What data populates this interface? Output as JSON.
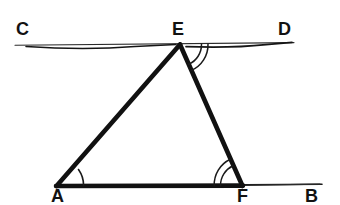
{
  "figure": {
    "background_color": "#ffffff",
    "ink_color": "#111111",
    "labels": [
      {
        "name": "C",
        "text": "C",
        "x": 16,
        "y": 20
      },
      {
        "name": "E",
        "text": "E",
        "x": 172,
        "y": 20
      },
      {
        "name": "D",
        "text": "D",
        "x": 278,
        "y": 20
      },
      {
        "name": "A",
        "text": "A",
        "x": 51,
        "y": 187
      },
      {
        "name": "F",
        "text": "F",
        "x": 237,
        "y": 187
      },
      {
        "name": "B",
        "text": "B",
        "x": 305,
        "y": 187
      }
    ],
    "points": {
      "A": {
        "x": 56,
        "y": 186
      },
      "B": {
        "x": 322,
        "y": 184
      },
      "C": {
        "x": 15,
        "y": 45
      },
      "D": {
        "x": 294,
        "y": 42
      },
      "E": {
        "x": 180,
        "y": 44
      },
      "F": {
        "x": 242,
        "y": 186
      }
    },
    "segments": [
      {
        "name": "line-cd",
        "from": "C",
        "to": "D",
        "weight": "thin",
        "label": "CD"
      },
      {
        "name": "line-ab",
        "from": "A",
        "to": "B",
        "weight": "thin",
        "label": "AB"
      },
      {
        "name": "side-af",
        "from": "A",
        "to": "F",
        "weight": "thick",
        "label": "AF"
      },
      {
        "name": "side-ae",
        "from": "A",
        "to": "E",
        "weight": "thick",
        "label": "AE"
      },
      {
        "name": "side-ef",
        "from": "E",
        "to": "F",
        "weight": "thick",
        "label": "EF"
      }
    ],
    "angle_marks": [
      {
        "name": "angle-a",
        "vertex": "A",
        "arcs": 1,
        "between": "AB and AE"
      },
      {
        "name": "angle-e",
        "vertex": "E",
        "arcs": 2,
        "between": "ED and EF"
      },
      {
        "name": "angle-f",
        "vertex": "F",
        "arcs": 2,
        "between": "FA and FE"
      }
    ]
  }
}
